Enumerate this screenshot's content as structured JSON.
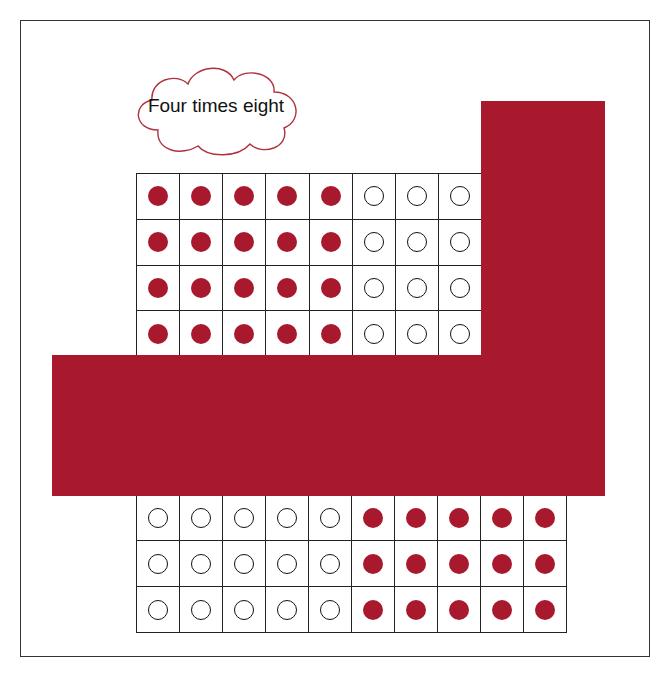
{
  "title_bubble": {
    "text": "Four times eight",
    "shape": "cloud",
    "outline_color": "#b0303c"
  },
  "colors": {
    "mask": "#a8192e",
    "filled_dot": "#a8192e",
    "grid_line": "#222222",
    "frame": "#333333"
  },
  "upper_grid": {
    "rows": 4,
    "cols": 8,
    "cells": [
      [
        "filled",
        "filled",
        "filled",
        "filled",
        "filled",
        "empty",
        "empty",
        "empty"
      ],
      [
        "filled",
        "filled",
        "filled",
        "filled",
        "filled",
        "empty",
        "empty",
        "empty"
      ],
      [
        "filled",
        "filled",
        "filled",
        "filled",
        "filled",
        "empty",
        "empty",
        "empty"
      ],
      [
        "filled",
        "filled",
        "filled",
        "filled",
        "filled",
        "empty",
        "empty",
        "empty"
      ]
    ]
  },
  "lower_grid": {
    "rows": 3,
    "cols": 10,
    "cells": [
      [
        "empty",
        "empty",
        "empty",
        "empty",
        "empty",
        "filled",
        "filled",
        "filled",
        "filled",
        "filled"
      ],
      [
        "empty",
        "empty",
        "empty",
        "empty",
        "empty",
        "filled",
        "filled",
        "filled",
        "filled",
        "filled"
      ],
      [
        "empty",
        "empty",
        "empty",
        "empty",
        "empty",
        "filled",
        "filled",
        "filled",
        "filled",
        "filled"
      ]
    ]
  },
  "masks": [
    {
      "name": "vertical-mask",
      "description": "red L-shaped cover, vertical part"
    },
    {
      "name": "horizontal-mask",
      "description": "red L-shaped cover, horizontal part"
    }
  ]
}
